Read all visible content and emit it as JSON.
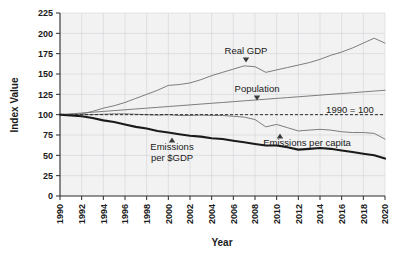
{
  "chart_data": {
    "type": "line",
    "title": "",
    "xlabel": "Year",
    "ylabel": "Index Value",
    "xlim": [
      1990,
      2020
    ],
    "ylim": [
      0,
      225
    ],
    "ytick_step": 25,
    "xtick_step": 2,
    "grid": true,
    "legend": "none (inline annotations)",
    "yticks": [
      0,
      25,
      50,
      75,
      100,
      125,
      150,
      175,
      200,
      225
    ],
    "xticks": [
      1990,
      1992,
      1994,
      1996,
      1998,
      2000,
      2002,
      2004,
      2006,
      2008,
      2010,
      2012,
      2014,
      2016,
      2018,
      2020
    ],
    "x": [
      1990,
      1991,
      1992,
      1993,
      1994,
      1995,
      1996,
      1997,
      1998,
      1999,
      2000,
      2001,
      2002,
      2003,
      2004,
      2005,
      2006,
      2007,
      2008,
      2009,
      2010,
      2011,
      2012,
      2013,
      2014,
      2015,
      2016,
      2017,
      2018,
      2019,
      2020
    ],
    "series": [
      {
        "name": "Real GDP",
        "style": "thin",
        "color": "#6f6f6f",
        "values": [
          100,
          99.5,
          101,
          104,
          108,
          111,
          115,
          120,
          125,
          130,
          136,
          137,
          139,
          143,
          148,
          152,
          156,
          160,
          159,
          152,
          155,
          158,
          161,
          164,
          168,
          173,
          177,
          182,
          188,
          194,
          188
        ]
      },
      {
        "name": "Population",
        "style": "thin",
        "color": "#6f6f6f",
        "values": [
          100,
          101,
          102,
          103,
          104,
          105,
          106,
          107,
          108,
          109,
          110,
          111,
          112,
          113,
          114,
          115,
          116,
          117,
          118,
          119,
          120,
          121,
          122,
          123,
          124,
          125,
          126,
          127,
          128,
          129,
          130
        ]
      },
      {
        "name": "Emissions per capita",
        "style": "thin",
        "color": "#6f6f6f",
        "values": [
          100,
          100.5,
          100,
          100,
          100.5,
          101,
          101,
          100.5,
          100,
          99.5,
          100,
          99,
          99,
          99.5,
          99,
          99,
          98,
          97,
          94,
          85,
          88,
          84,
          80,
          81,
          82,
          81,
          79,
          78,
          78,
          77,
          70
        ]
      },
      {
        "name": "Emissions per $GDP",
        "style": "bold",
        "color": "#1a1a1a",
        "values": [
          100,
          99,
          98,
          96,
          93,
          91,
          88,
          85,
          83,
          80,
          78,
          76,
          74,
          73,
          71,
          70,
          68,
          66,
          64,
          62,
          62,
          60,
          57,
          58,
          59,
          58,
          56,
          54,
          52,
          50,
          46
        ]
      }
    ],
    "annotations": [
      {
        "id": "real-gdp",
        "text": "Real GDP",
        "marker": "down-triangle",
        "x_px": 246,
        "y_px": 54,
        "marker_x_px": 246,
        "marker_y_px": 61
      },
      {
        "id": "population",
        "text": "Population",
        "marker": "down-triangle",
        "x_px": 257,
        "y_px": 92,
        "marker_x_px": 257,
        "marker_y_px": 99
      },
      {
        "id": "baseline",
        "text": "1990 = 100",
        "marker": "none",
        "x_px": 350,
        "y_px": 113
      },
      {
        "id": "emissions-per-gdp-l1",
        "text": "Emissions",
        "marker": "up-triangle",
        "x_px": 172,
        "y_px": 150,
        "marker_x_px": 172,
        "marker_y_px": 141
      },
      {
        "id": "emissions-per-gdp-l2",
        "text": "per $GDP",
        "marker": "none",
        "x_px": 172,
        "y_px": 161
      },
      {
        "id": "emissions-per-capita",
        "text": "Emissions per capita",
        "marker": "up-triangle",
        "x_px": 307,
        "y_px": 146,
        "marker_x_px": 280,
        "marker_y_px": 137
      }
    ],
    "reference_line": {
      "label": "1990 = 100",
      "value": 100,
      "style": "dashed"
    }
  },
  "axes": {
    "y_title": "Index Value",
    "x_title": "Year"
  }
}
